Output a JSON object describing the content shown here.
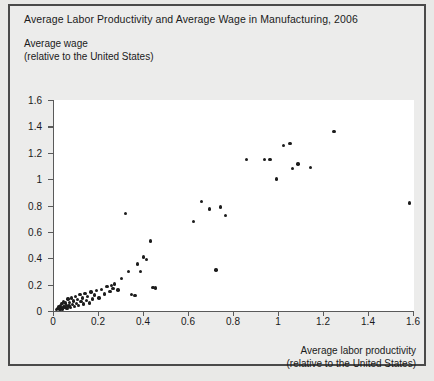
{
  "chart_data": {
    "type": "scatter",
    "title": "Average Labor Productivity and Average Wage in Manufacturing, 2006",
    "xlabel": "Average labor productivity",
    "xlabel_sub": "(relative to the United States)",
    "ylabel": "Average wage",
    "ylabel_sub": "(relative to the United States)",
    "xlim": [
      0,
      1.6
    ],
    "ylim": [
      0,
      1.6
    ],
    "xticks": [
      0,
      0.2,
      0.4,
      0.6,
      0.8,
      1,
      1.2,
      1.4,
      1.6
    ],
    "xtick_labels": [
      "0",
      "0.2",
      "0.4",
      "0.6",
      "0.8",
      "1",
      "1.2",
      "1.4",
      "1.6"
    ],
    "yticks": [
      0,
      0.2,
      0.4,
      0.6,
      0.8,
      1,
      1.2,
      1.4,
      1.6
    ],
    "ytick_labels": [
      "0",
      "0.2",
      "0.4",
      "0.6",
      "0.8",
      "1",
      "1.2",
      "1.4",
      "1.6"
    ],
    "grid": false,
    "legend": false,
    "marker_color": "#1c1c1c",
    "points": [
      [
        0.012,
        0.01
      ],
      [
        0.018,
        0.018
      ],
      [
        0.022,
        0.03
      ],
      [
        0.026,
        0.012
      ],
      [
        0.03,
        0.04
      ],
      [
        0.032,
        0.022
      ],
      [
        0.036,
        0.055
      ],
      [
        0.038,
        0.016
      ],
      [
        0.042,
        0.07
      ],
      [
        0.044,
        0.034
      ],
      [
        0.048,
        0.026
      ],
      [
        0.052,
        0.06
      ],
      [
        0.055,
        0.044
      ],
      [
        0.058,
        0.018
      ],
      [
        0.062,
        0.09
      ],
      [
        0.066,
        0.038
      ],
      [
        0.07,
        0.066
      ],
      [
        0.074,
        0.028
      ],
      [
        0.078,
        0.1
      ],
      [
        0.082,
        0.05
      ],
      [
        0.086,
        0.075
      ],
      [
        0.09,
        0.032
      ],
      [
        0.095,
        0.11
      ],
      [
        0.1,
        0.058
      ],
      [
        0.104,
        0.086
      ],
      [
        0.11,
        0.044
      ],
      [
        0.115,
        0.125
      ],
      [
        0.12,
        0.07
      ],
      [
        0.126,
        0.098
      ],
      [
        0.132,
        0.052
      ],
      [
        0.138,
        0.135
      ],
      [
        0.144,
        0.078
      ],
      [
        0.15,
        0.112
      ],
      [
        0.158,
        0.062
      ],
      [
        0.165,
        0.145
      ],
      [
        0.172,
        0.09
      ],
      [
        0.18,
        0.12
      ],
      [
        0.19,
        0.155
      ],
      [
        0.2,
        0.1
      ],
      [
        0.212,
        0.165
      ],
      [
        0.224,
        0.13
      ],
      [
        0.236,
        0.185
      ],
      [
        0.248,
        0.148
      ],
      [
        0.255,
        0.195
      ],
      [
        0.262,
        0.172
      ],
      [
        0.27,
        0.205
      ],
      [
        0.285,
        0.16
      ],
      [
        0.3,
        0.245
      ],
      [
        0.318,
        0.74
      ],
      [
        0.33,
        0.3
      ],
      [
        0.345,
        0.125
      ],
      [
        0.36,
        0.118
      ],
      [
        0.372,
        0.355
      ],
      [
        0.385,
        0.3
      ],
      [
        0.398,
        0.41
      ],
      [
        0.412,
        0.39
      ],
      [
        0.428,
        0.53
      ],
      [
        0.44,
        0.18
      ],
      [
        0.452,
        0.175
      ],
      [
        0.62,
        0.68
      ],
      [
        0.655,
        0.83
      ],
      [
        0.69,
        0.775
      ],
      [
        0.72,
        0.31
      ],
      [
        0.74,
        0.79
      ],
      [
        0.762,
        0.725
      ],
      [
        0.855,
        1.15
      ],
      [
        0.935,
        1.15
      ],
      [
        0.96,
        1.15
      ],
      [
        0.99,
        1.0
      ],
      [
        1.02,
        1.255
      ],
      [
        1.048,
        1.27
      ],
      [
        1.06,
        1.08
      ],
      [
        1.085,
        1.115
      ],
      [
        1.14,
        1.09
      ],
      [
        1.245,
        1.36
      ],
      [
        1.58,
        0.82
      ]
    ]
  }
}
